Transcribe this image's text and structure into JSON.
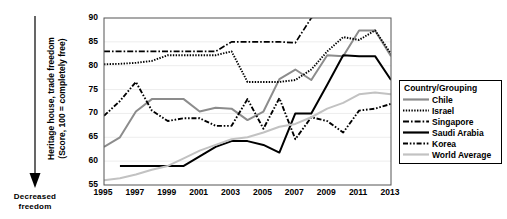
{
  "annotation": {
    "arrow_icon": "down-arrow-icon",
    "label_line1": "Decreased",
    "label_line2": "freedom"
  },
  "axis": {
    "y_title_line1": "Heritage house, trade  freedom",
    "y_title_line2": "(Score, 100 = completely free)",
    "y_ticks": [
      "55",
      "60",
      "65",
      "70",
      "75",
      "80",
      "85",
      "90"
    ],
    "x_ticks": [
      "1995",
      "1997",
      "1999",
      "2001",
      "2003",
      "2005",
      "2007",
      "2009",
      "2011",
      "2013"
    ]
  },
  "legend": {
    "title": "Country/Grouping",
    "items": [
      {
        "label": "Chile",
        "style": "solid-gray",
        "color": "#8c8c8c"
      },
      {
        "label": "Israel",
        "style": "dotted",
        "color": "#000000"
      },
      {
        "label": "Singapore",
        "style": "dash-dot",
        "color": "#000000"
      },
      {
        "label": "Saudi Arabia",
        "style": "solid-black",
        "color": "#000000"
      },
      {
        "label": "Korea",
        "style": "dash-dot-dot",
        "color": "#000000"
      },
      {
        "label": "World  Average",
        "style": "solid-light",
        "color": "#c2c2c2"
      }
    ]
  },
  "chart_data": {
    "type": "line",
    "title": "",
    "xlabel": "",
    "ylabel": "Heritage house, trade freedom (Score, 100 = completely free)",
    "xlim": [
      1995,
      2013
    ],
    "ylim": [
      55,
      90
    ],
    "grid": true,
    "legend_position": "right",
    "x": [
      1995,
      1996,
      1997,
      1998,
      1999,
      2000,
      2001,
      2002,
      2003,
      2004,
      2005,
      2006,
      2007,
      2008,
      2009,
      2010,
      2011,
      2012,
      2013
    ],
    "series": [
      {
        "name": "Chile",
        "color": "#8c8c8c",
        "style": "solid-gray",
        "values": [
          63.0,
          65.0,
          70.4,
          73.0,
          73.0,
          73.0,
          70.4,
          71.2,
          71.0,
          68.6,
          70.4,
          77.2,
          79.2,
          77.0,
          82.2,
          82.0,
          87.4,
          87.4,
          82.0
        ]
      },
      {
        "name": "Israel",
        "color": "#000000",
        "style": "dotted",
        "values": [
          80.3,
          80.4,
          80.6,
          81.0,
          82.2,
          82.2,
          82.2,
          82.2,
          83.0,
          76.6,
          76.6,
          76.6,
          77.0,
          79.2,
          83.0,
          86.0,
          85.4,
          87.4,
          82.5
        ]
      },
      {
        "name": "Singapore",
        "color": "#000000",
        "style": "dash-dot",
        "values": [
          83.0,
          83.0,
          83.0,
          83.0,
          83.0,
          83.0,
          83.0,
          83.0,
          85.0,
          85.0,
          85.0,
          85.0,
          84.8,
          90.0,
          null,
          null,
          null,
          null,
          null
        ],
        "note": "Rises above chart maximum of 90 after 2007; line exits top of plot area"
      },
      {
        "name": "Saudi Arabia",
        "color": "#000000",
        "style": "solid-black",
        "values": [
          null,
          59.0,
          59.0,
          59.0,
          59.0,
          59.0,
          61.0,
          63.0,
          64.2,
          64.2,
          63.4,
          61.8,
          70.0,
          70.0,
          76.0,
          82.2,
          82.0,
          82.0,
          77.0
        ]
      },
      {
        "name": "Korea",
        "color": "#000000",
        "style": "dash-dot-dot",
        "values": [
          69.5,
          72.6,
          76.6,
          70.6,
          68.4,
          69.0,
          69.0,
          67.4,
          67.4,
          73.0,
          66.8,
          73.2,
          64.6,
          69.2,
          68.4,
          66.0,
          70.6,
          71.0,
          72.0
        ]
      },
      {
        "name": "World Average",
        "color": "#c2c2c2",
        "style": "solid-light",
        "values": [
          56.0,
          56.4,
          57.2,
          58.2,
          59.0,
          60.6,
          62.2,
          63.4,
          64.6,
          65.0,
          66.0,
          67.2,
          67.8,
          69.2,
          71.0,
          72.2,
          74.0,
          74.4,
          74.0
        ]
      }
    ]
  }
}
